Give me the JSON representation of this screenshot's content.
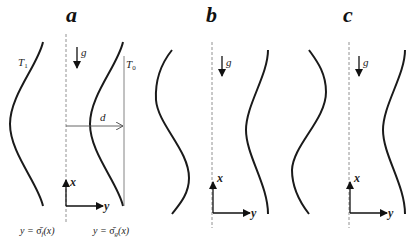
{
  "figure": {
    "panels": [
      {
        "id": "a",
        "label": "a",
        "gravity_label": "g⃗",
        "x_axis_label": "x",
        "y_axis_label": "y",
        "left_wall_label": "T",
        "left_wall_sub": "1",
        "right_wall_label": "T",
        "right_wall_sub": "0",
        "distance_label": "d",
        "left_interface_caption": "y = σ̄_f(x)",
        "right_interface_caption": "y = σ̄_g(x)",
        "left_caption_pre": "y = ",
        "left_caption_sym": "σ̄",
        "left_caption_sub": "f",
        "left_caption_post": "(x)",
        "right_caption_pre": "y = ",
        "right_caption_sym": "σ̄",
        "right_caption_sub": "g",
        "right_caption_post": "(x)"
      },
      {
        "id": "b",
        "label": "b",
        "gravity_label": "g⃗",
        "x_axis_label": "x",
        "y_axis_label": "y"
      },
      {
        "id": "c",
        "label": "c",
        "gravity_label": "g⃗",
        "x_axis_label": "x",
        "y_axis_label": "y"
      }
    ]
  }
}
